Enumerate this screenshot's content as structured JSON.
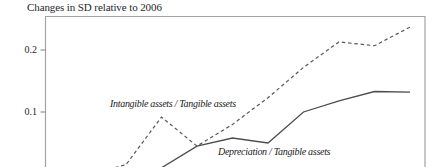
{
  "figure": {
    "title": "Changes in SD relative to 2006"
  },
  "axis": {
    "y_ticks": [
      {
        "label": "0.2",
        "value": 0.2
      },
      {
        "label": "0.1",
        "value": 0.1
      }
    ]
  },
  "colors": {
    "background": "#ffffff",
    "frame": "#a3a3a3",
    "tick": "#8a8a8a",
    "solid_line": "#4d4d4d",
    "dashed_line": "#585858",
    "text": "#1f1f1f"
  },
  "chart_data": {
    "type": "line",
    "title": "Changes in SD relative to 2006",
    "xlabel": "",
    "ylabel": "Changes in SD relative to 2006",
    "x": [
      2006,
      2007,
      2008,
      2009,
      2010,
      2011,
      2012,
      2013,
      2014,
      2015
    ],
    "series": [
      {
        "name": "Intangible assets / Tangible assets",
        "line_style": "dashed",
        "values": [
          0,
          0.015,
          0.092,
          0.045,
          0.08,
          0.123,
          0.172,
          0.213,
          0.207,
          0.237
        ]
      },
      {
        "name": "Depreciation / Tangible assets",
        "line_style": "solid",
        "values": [
          0,
          0.003,
          0.01,
          0.045,
          0.058,
          0.05,
          0.1,
          0.118,
          0.133,
          0.132
        ]
      }
    ],
    "ylim": [
      0,
      0.26
    ],
    "grid": false,
    "legend_position": "inline-labels",
    "layout_note": "bottom x-axis and year tick labels are cropped out of the visible image; series values are 0 at baseline year 2006"
  }
}
